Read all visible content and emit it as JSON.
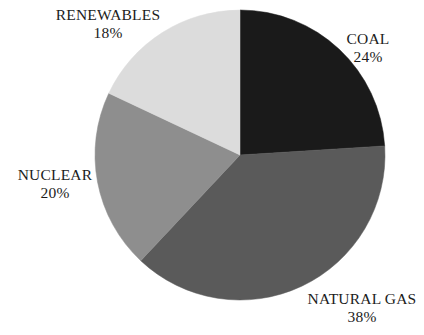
{
  "chart_data": {
    "type": "pie",
    "title": "",
    "subtitle": "",
    "xlabel": "",
    "ylabel": "",
    "legend_position": "none",
    "grid": false,
    "labels_inline": true,
    "start_angle_deg": 0,
    "direction": "clockwise",
    "center": {
      "x": 240,
      "y": 155
    },
    "radius": 145,
    "categories": [
      "COAL",
      "NATURAL GAS",
      "NUCLEAR",
      "RENEWABLES"
    ],
    "values": [
      24,
      38,
      20,
      18
    ],
    "value_suffix": "%",
    "slices": [
      {
        "name": "COAL",
        "value": 24,
        "value_label": "24%",
        "color": "#1a1a1a",
        "start_deg": 0,
        "end_deg": 86.4,
        "label_position": "right-top"
      },
      {
        "name": "NATURAL GAS",
        "value": 38,
        "value_label": "38%",
        "color": "#5a5a5a",
        "start_deg": 86.4,
        "end_deg": 223.2,
        "label_position": "bottom-right"
      },
      {
        "name": "NUCLEAR",
        "value": 20,
        "value_label": "20%",
        "color": "#8e8e8e",
        "start_deg": 223.2,
        "end_deg": 295.2,
        "label_position": "left"
      },
      {
        "name": "RENEWABLES",
        "value": 18,
        "value_label": "18%",
        "color": "#dcdcdc",
        "start_deg": 295.2,
        "end_deg": 360,
        "label_position": "top-left"
      }
    ],
    "background_color": "#ffffff",
    "text_color": "#1c1c1c"
  },
  "labels": {
    "renewables": {
      "name": "RENEWABLES",
      "value": "18%"
    },
    "coal": {
      "name": "COAL",
      "value": "24%"
    },
    "nuclear": {
      "name": "NUCLEAR",
      "value": "20%"
    },
    "natural_gas": {
      "name": "NATURAL GAS",
      "value": "38%"
    }
  }
}
